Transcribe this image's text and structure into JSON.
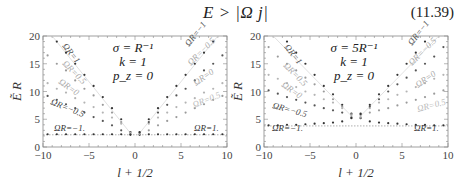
{
  "equation": {
    "formula": "E > |Ω j|",
    "number": "(11.39)"
  },
  "chart_data": [
    {
      "type": "scatter",
      "title": "",
      "xlabel": "l + 1/2",
      "ylabel": "Ẽ_l R",
      "xlim": [
        -10,
        10
      ],
      "ylim": [
        0,
        20
      ],
      "xticks": [
        -10,
        -5,
        0,
        5,
        10
      ],
      "yticks": [
        0,
        5,
        10,
        15,
        20
      ],
      "grid": false,
      "params": [
        "σ = R⁻¹",
        "k = 1",
        "p_z = 0"
      ],
      "x": [
        -9.5,
        -8.5,
        -7.5,
        -6.5,
        -5.5,
        -4.5,
        -3.5,
        -2.5,
        -1.5,
        -0.5,
        0.5,
        1.5,
        2.5,
        3.5,
        4.5,
        5.5,
        6.5,
        7.5,
        8.5,
        9.5
      ],
      "series": [
        {
          "name": "ΩR=1",
          "label_side": "left",
          "color": "#333333",
          "values": [
            null,
            19.0,
            17.0,
            15.0,
            13.0,
            11.0,
            9.0,
            7.0,
            5.0,
            2.7,
            2.2,
            2.3,
            2.3,
            2.3,
            2.3,
            2.3,
            2.3,
            2.3,
            2.3,
            2.3
          ]
        },
        {
          "name": "ΩR=0.5",
          "label_side": "left",
          "color": "#9a9a9a",
          "values": [
            16.5,
            15.0,
            13.8,
            12.0,
            10.5,
            9.3,
            7.6,
            6.2,
            4.5,
            2.6,
            2.3,
            3.0,
            3.9,
            4.7,
            5.4,
            6.2,
            7.0,
            7.7,
            8.5,
            9.2
          ]
        },
        {
          "name": "ΩR=0",
          "label_side": "both",
          "color": "#b4b4b4",
          "values": [
            11.5,
            10.5,
            9.8,
            8.8,
            8.0,
            7.2,
            6.2,
            5.3,
            4.2,
            2.5,
            2.5,
            4.2,
            5.3,
            6.2,
            7.2,
            8.0,
            8.8,
            9.8,
            10.5,
            11.5
          ]
        },
        {
          "name": "ΩR=-0.5",
          "label_side": "left",
          "color": "#555555",
          "values": [
            9.2,
            8.5,
            7.7,
            7.0,
            6.2,
            5.4,
            4.7,
            3.9,
            3.0,
            2.3,
            2.6,
            4.5,
            6.2,
            7.6,
            9.3,
            10.5,
            12.0,
            13.8,
            15.0,
            16.5
          ]
        },
        {
          "name": "ΩR=-1",
          "label_side": "left",
          "color": "#333333",
          "values": [
            2.3,
            2.3,
            2.3,
            2.3,
            2.3,
            2.3,
            2.3,
            2.3,
            2.3,
            2.2,
            2.7,
            5.0,
            7.0,
            9.0,
            11.0,
            13.0,
            15.0,
            17.0,
            19.0,
            null
          ]
        }
      ],
      "annotations": [
        "ΩR=1",
        "ΩR=0.5",
        "ΩR=0",
        "ΩR=−0.5",
        "ΩR=−1.",
        "ΩR=−1",
        "ΩR=−0.5",
        "ΩR=0",
        "ΩR=0.5",
        "ΩR=1."
      ],
      "asymptote_y": 2.2
    },
    {
      "type": "scatter",
      "title": "",
      "xlabel": "l + 1/2",
      "ylabel": "Ẽ_l R",
      "xlim": [
        -10,
        10
      ],
      "ylim": [
        0,
        20
      ],
      "xticks": [
        -10,
        -5,
        0,
        5,
        10
      ],
      "yticks": [
        0,
        5,
        10,
        15,
        20
      ],
      "grid": false,
      "params": [
        "σ = 5R⁻¹",
        "k = 1",
        "p_z = 0"
      ],
      "x": [
        -9.5,
        -8.5,
        -7.5,
        -6.5,
        -5.5,
        -4.5,
        -3.5,
        -2.5,
        -1.5,
        -0.5,
        0.5,
        1.5,
        2.5,
        3.5,
        4.5,
        5.5,
        6.5,
        7.5,
        8.5,
        9.5
      ],
      "series": [
        {
          "name": "ΩR=1",
          "label_side": "left",
          "color": "#333333",
          "values": [
            null,
            null,
            19.0,
            17.0,
            15.0,
            13.0,
            11.0,
            9.5,
            7.6,
            6.0,
            5.2,
            4.6,
            4.4,
            4.3,
            4.2,
            4.1,
            4.0,
            4.0,
            3.9,
            3.9
          ]
        },
        {
          "name": "ΩR=0.5",
          "label_side": "left",
          "color": "#9a9a9a",
          "values": [
            18.0,
            16.3,
            15.0,
            13.8,
            12.5,
            11.3,
            10.0,
            8.6,
            7.3,
            5.9,
            5.3,
            6.2,
            6.6,
            7.0,
            7.5,
            8.0,
            8.5,
            9.0,
            9.6,
            10.2
          ]
        },
        {
          "name": "ΩR=0",
          "label_side": "both",
          "color": "#b4b4b4",
          "values": [
            13.0,
            12.3,
            11.5,
            10.8,
            10.0,
            9.4,
            8.6,
            8.0,
            7.0,
            5.6,
            5.6,
            7.0,
            8.0,
            8.6,
            9.4,
            10.0,
            10.8,
            11.5,
            12.3,
            13.0
          ]
        },
        {
          "name": "ΩR=-0.5",
          "label_side": "left",
          "color": "#555555",
          "values": [
            10.2,
            9.6,
            9.0,
            8.5,
            8.0,
            7.5,
            7.0,
            6.6,
            6.2,
            5.3,
            5.9,
            7.3,
            8.6,
            10.0,
            11.3,
            12.5,
            13.8,
            15.0,
            16.3,
            18.0
          ]
        },
        {
          "name": "ΩR=-1",
          "label_side": "left",
          "color": "#333333",
          "values": [
            3.9,
            3.9,
            4.0,
            4.0,
            4.1,
            4.2,
            4.3,
            4.4,
            4.6,
            5.2,
            6.0,
            7.6,
            9.5,
            11.0,
            13.0,
            15.0,
            17.0,
            19.0,
            null,
            null
          ]
        }
      ],
      "annotations": [
        "ΩR=1",
        "ΩR=0.5",
        "ΩR=0",
        "ΩR=−0.5",
        "ΩR=−1.",
        "ΩR=−1",
        "ΩR=−0.5",
        "ΩR=0",
        "ΩR=0.5",
        "ΩR=1."
      ],
      "asymptote_y": 3.8
    }
  ],
  "plots": [
    {
      "frame": {
        "x0": 43,
        "y0": 36,
        "x1": 227,
        "y1": 147
      },
      "labels": [
        {
          "text": "ΩR=1",
          "x": 62,
          "y": 46,
          "rot": 52,
          "color": "#555"
        },
        {
          "text": "ΩR=0.5",
          "x": 62,
          "y": 64,
          "rot": 45,
          "color": "#aaa"
        },
        {
          "text": "ΩR=0",
          "x": 58,
          "y": 83,
          "rot": 35,
          "color": "#aaa"
        },
        {
          "text": "ΩR=−0.5",
          "x": 50,
          "y": 104,
          "rot": 22,
          "color": "#444"
        },
        {
          "text": "ΩR=−1.",
          "x": 54,
          "y": 131,
          "rot": 0,
          "color": "#333"
        },
        {
          "text": "ΩR=−1",
          "x": 189,
          "y": 47,
          "rot": -52,
          "color": "#555"
        },
        {
          "text": "ΩR=−0.5",
          "x": 191,
          "y": 66,
          "rot": -45,
          "color": "#aaa"
        },
        {
          "text": "ΩR=0",
          "x": 196,
          "y": 86,
          "rot": -35,
          "color": "#aaa"
        },
        {
          "text": "ΩR=0.5",
          "x": 194,
          "y": 108,
          "rot": -22,
          "color": "#bbb"
        },
        {
          "text": "ΩR=1.",
          "x": 194,
          "y": 131,
          "rot": 0,
          "color": "#333"
        }
      ],
      "param_x": 133,
      "param_y": [
        52,
        66,
        80
      ]
    },
    {
      "frame": {
        "x0": 264,
        "y0": 36,
        "x1": 448,
        "y1": 147
      },
      "labels": [
        {
          "text": "ΩR=1",
          "x": 284,
          "y": 47,
          "rot": 52,
          "color": "#555"
        },
        {
          "text": "ΩR=0.5",
          "x": 283,
          "y": 66,
          "rot": 45,
          "color": "#aaa"
        },
        {
          "text": "ΩR=0",
          "x": 281,
          "y": 86,
          "rot": 35,
          "color": "#aaa"
        },
        {
          "text": "ΩR=−0.5",
          "x": 272,
          "y": 108,
          "rot": 15,
          "color": "#444"
        },
        {
          "text": "ΩR=−1.",
          "x": 272,
          "y": 131,
          "rot": 0,
          "color": "#333"
        },
        {
          "text": "ΩR=−1",
          "x": 412,
          "y": 46,
          "rot": -52,
          "color": "#555"
        },
        {
          "text": "ΩR=−0.5",
          "x": 412,
          "y": 66,
          "rot": -45,
          "color": "#aaa"
        },
        {
          "text": "ΩR=0",
          "x": 418,
          "y": 88,
          "rot": -35,
          "color": "#aaa"
        },
        {
          "text": "ΩR=0.5",
          "x": 418,
          "y": 112,
          "rot": -15,
          "color": "#bbb"
        },
        {
          "text": "ΩR=1.",
          "x": 414,
          "y": 131,
          "rot": 0,
          "color": "#333"
        }
      ],
      "param_x": 354,
      "param_y": [
        52,
        66,
        80
      ]
    }
  ]
}
